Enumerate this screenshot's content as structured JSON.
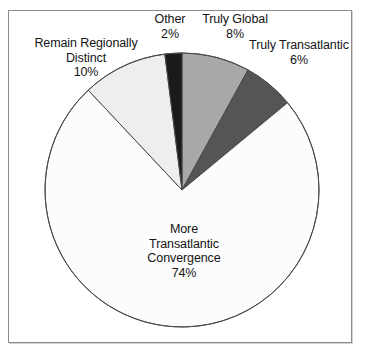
{
  "chart_data": {
    "type": "pie",
    "title": "",
    "subtitle": "",
    "xlabel": "",
    "ylabel": "",
    "legend_position": "none",
    "grid": false,
    "units": "percent",
    "total": 100,
    "categories": [
      "Truly Global",
      "Truly Transatlantic",
      "More Transatlantic Convergence",
      "Remain Regionally Distinct",
      "Other"
    ],
    "values": [
      8,
      6,
      74,
      10,
      2
    ],
    "slice_colors": [
      "#a8a8a8",
      "#555555",
      "#fcfcfc",
      "#eeeeee",
      "#1a1a1a"
    ],
    "start_angle_deg": 0,
    "direction": "clockwise",
    "slices": [
      {
        "label": "Truly Global",
        "value": 8,
        "value_text": "8%",
        "color": "#a8a8a8",
        "start_deg": 0,
        "end_deg": 28.8
      },
      {
        "label": "Truly Transatlantic",
        "value": 6,
        "value_text": "6%",
        "color": "#555555",
        "start_deg": 28.8,
        "end_deg": 50.4
      },
      {
        "label": "More Transatlantic Convergence",
        "value": 74,
        "value_text": "74%",
        "color": "#fcfcfc",
        "start_deg": 50.4,
        "end_deg": 316.8
      },
      {
        "label": "Remain Regionally Distinct",
        "value": 10,
        "value_text": "10%",
        "color": "#eeeeee",
        "start_deg": 316.8,
        "end_deg": 352.8
      },
      {
        "label": "Other",
        "value": 2,
        "value_text": "2%",
        "color": "#1a1a1a",
        "start_deg": 352.8,
        "end_deg": 360
      }
    ]
  },
  "labels": {
    "remain_regionally_distinct": "Remain Regionally\nDistinct\n10%",
    "other": "Other\n2%",
    "truly_global": "Truly Global\n8%",
    "truly_transatlantic": "Truly Transatlantic\n6%",
    "more_transatlantic_convergence": "More\nTransatlantic\nConvergence\n74%"
  },
  "style": {
    "frame_border_color": "#8c8c8c",
    "slice_outline_color": "#4a4a4a",
    "background_color": "#ffffff",
    "text_color": "#141414"
  }
}
